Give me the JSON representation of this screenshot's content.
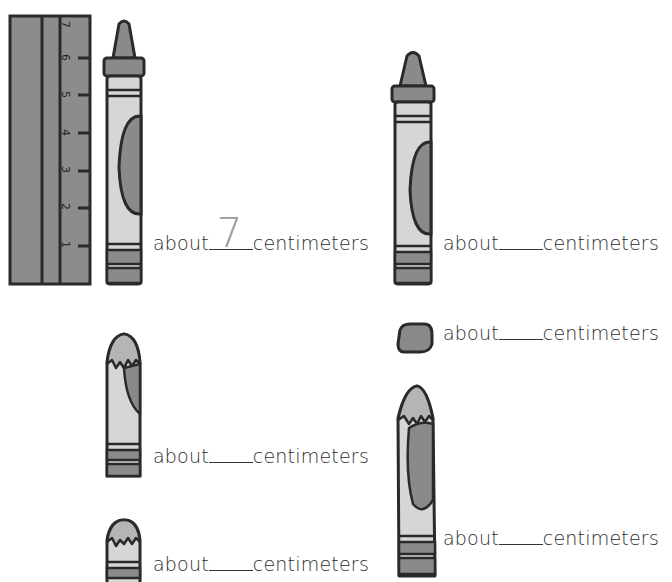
{
  "ruler": {
    "ticks": [
      "1",
      "2",
      "3",
      "4",
      "5",
      "6",
      "7"
    ],
    "unit": "centimeters",
    "color": "#8c8c8c"
  },
  "items": [
    {
      "id": "crayon-1",
      "prefix": "about",
      "answer": "7",
      "suffix": "centimeters",
      "length_cm": 7
    },
    {
      "id": "crayon-2",
      "prefix": "about",
      "answer": "",
      "suffix": "centimeters"
    },
    {
      "id": "crayon-3",
      "prefix": "about",
      "answer": "",
      "suffix": "centimeters"
    },
    {
      "id": "crayon-4",
      "prefix": "about",
      "answer": "",
      "suffix": "centimeters"
    },
    {
      "id": "crayon-5",
      "prefix": "about",
      "answer": "",
      "suffix": "centimeters"
    },
    {
      "id": "crayon-6",
      "prefix": "about",
      "answer": "",
      "suffix": "centimeters"
    }
  ],
  "colors": {
    "outline": "#2a2a2a",
    "dark_gray": "#8a8a8a",
    "light_gray": "#d6d6d6",
    "mid_gray": "#b5b5b5"
  }
}
